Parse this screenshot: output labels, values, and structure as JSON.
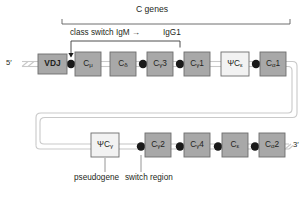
{
  "figure": {
    "title_bracket": "C genes",
    "annotations": {
      "class_switch": "class switch IgM →",
      "target_isotype": "IgG1",
      "pseudogene": "pseudogene",
      "switch_region": "switch region"
    },
    "ends": {
      "five_prime": "5′",
      "three_prime": "3′"
    }
  },
  "colors": {
    "gene_fill": "#a8a8a8",
    "pseudogene_fill": "#f2f2f2",
    "vdj_fill": "#a8a8a8",
    "stroke": "#6d6d6d",
    "line": "#c9c9c9",
    "dot": "#1a1a1a",
    "text": "#231f20"
  },
  "top_row": [
    {
      "name": "vdj-segment",
      "label": "VDJ",
      "sub": "",
      "type": "vdj",
      "x": 38,
      "y": 54,
      "w": 29,
      "h": 20
    },
    {
      "name": "gene-c-mu",
      "label": "C",
      "sub": "μ",
      "type": "gene",
      "x": 75,
      "y": 52,
      "w": 26,
      "h": 24
    },
    {
      "name": "gene-c-delta",
      "label": "C",
      "sub": "δ",
      "type": "gene",
      "x": 110,
      "y": 52,
      "w": 26,
      "h": 24
    },
    {
      "name": "gene-c-gamma-3",
      "label": "C",
      "sub": "γ",
      "suffix": "3",
      "type": "gene",
      "x": 147,
      "y": 52,
      "w": 26,
      "h": 24
    },
    {
      "name": "gene-c-gamma-1",
      "label": "C",
      "sub": "γ",
      "suffix": "1",
      "type": "gene",
      "x": 184,
      "y": 52,
      "w": 26,
      "h": 24
    },
    {
      "name": "pseudogene-psi-c-epsilon",
      "label": "ΨC",
      "sub": "ε",
      "type": "pseudogene",
      "x": 221,
      "y": 52,
      "w": 28,
      "h": 24
    },
    {
      "name": "gene-c-alpha-1",
      "label": "C",
      "sub": "α",
      "suffix": "1",
      "type": "gene",
      "x": 260,
      "y": 52,
      "w": 26,
      "h": 24
    }
  ],
  "bottom_row": [
    {
      "name": "pseudogene-psi-c-gamma",
      "label": "ΨC",
      "sub": "γ",
      "type": "pseudogene",
      "x": 91,
      "y": 133,
      "w": 28,
      "h": 24
    },
    {
      "name": "gene-c-gamma-2",
      "label": "C",
      "sub": "γ",
      "suffix": "2",
      "type": "gene",
      "x": 145,
      "y": 133,
      "w": 26,
      "h": 24
    },
    {
      "name": "gene-c-gamma-4",
      "label": "C",
      "sub": "γ",
      "suffix": "4",
      "type": "gene",
      "x": 184,
      "y": 133,
      "w": 26,
      "h": 24
    },
    {
      "name": "gene-c-epsilon",
      "label": "C",
      "sub": "ε",
      "type": "gene",
      "x": 222,
      "y": 133,
      "w": 26,
      "h": 24
    },
    {
      "name": "gene-c-alpha-2",
      "label": "C",
      "sub": "α",
      "suffix": "2",
      "type": "gene",
      "x": 259,
      "y": 133,
      "w": 26,
      "h": 24
    }
  ],
  "switch_dots_top": [
    71,
    143,
    180,
    256
  ],
  "switch_dots_bottom": [
    141,
    180,
    218,
    255
  ]
}
